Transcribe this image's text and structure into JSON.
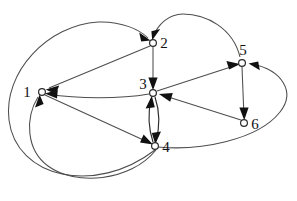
{
  "figure": {
    "background_color": "#ffffff",
    "edge_color": "#4d4d4d",
    "arrow_color": "#111111",
    "node_fill": "#ffffff",
    "node_stroke": "#2b2b2b"
  },
  "nodes": [
    {
      "id": "1",
      "label": "1",
      "cx": 42,
      "cy": 92,
      "r": 3.4,
      "label_x": 27,
      "label_y": 97
    },
    {
      "id": "2",
      "label": "2",
      "cx": 153,
      "cy": 43,
      "r": 3.4,
      "label_x": 160,
      "label_y": 48
    },
    {
      "id": "3",
      "label": "3",
      "cx": 153,
      "cy": 93,
      "r": 3.4,
      "label_x": 140,
      "label_y": 89
    },
    {
      "id": "4",
      "label": "4",
      "cx": 155,
      "cy": 146,
      "r": 3.4,
      "label_x": 162,
      "label_y": 152
    },
    {
      "id": "5",
      "label": "5",
      "cx": 242,
      "cy": 63,
      "r": 3.4,
      "label_x": 240,
      "label_y": 56
    },
    {
      "id": "6",
      "label": "6",
      "cx": 244,
      "cy": 123,
      "r": 3.4,
      "label_x": 251,
      "label_y": 129
    }
  ],
  "edges": [
    {
      "id": "e-2-1",
      "from": "2",
      "to": "1",
      "shape": "straight",
      "directed": true
    },
    {
      "id": "e-3-1",
      "from": "3",
      "to": "1",
      "shape": "curved",
      "directed": true
    },
    {
      "id": "e-1-4",
      "from": "1",
      "to": "4",
      "shape": "straight",
      "directed": true
    },
    {
      "id": "e-2-3",
      "from": "2",
      "to": "3",
      "shape": "straight",
      "directed": true
    },
    {
      "id": "e-3-4",
      "from": "3",
      "to": "4",
      "shape": "curved",
      "directed": true
    },
    {
      "id": "e-4-3",
      "from": "4",
      "to": "3",
      "shape": "curved",
      "directed": true
    },
    {
      "id": "e-3-5",
      "from": "3",
      "to": "5",
      "shape": "straight",
      "directed": true
    },
    {
      "id": "e-5-6",
      "from": "5",
      "to": "6",
      "shape": "straight",
      "directed": true
    },
    {
      "id": "e-6-3",
      "from": "6",
      "to": "3",
      "shape": "straight",
      "directed": true
    },
    {
      "id": "e-5-2",
      "from": "5",
      "to": "2",
      "shape": "arc-over-top",
      "directed": true
    },
    {
      "id": "e-4-2",
      "from": "4",
      "to": "2",
      "shape": "arc-around-left",
      "directed": true
    },
    {
      "id": "e-4-5",
      "from": "4",
      "to": "5",
      "shape": "arc-around-right",
      "directed": true
    },
    {
      "id": "e-4-1",
      "from": "4",
      "to": "1",
      "shape": "arc-around-bottom-left",
      "directed": true
    }
  ],
  "counts": {
    "nodes": 6,
    "edges": 13
  }
}
